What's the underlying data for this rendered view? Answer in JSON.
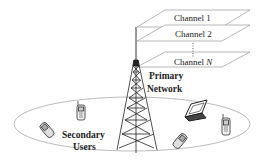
{
  "diagram": {
    "channels": [
      {
        "label": "Channel 1"
      },
      {
        "label": "Channel 2"
      },
      {
        "label": "Channel ",
        "suffix_italic": "N"
      }
    ],
    "primary_network": {
      "line1": "Primary",
      "line2": "Network"
    },
    "secondary_users": {
      "line1": "Secondary",
      "line2": "Users"
    },
    "devices": [
      "flip-phone-left",
      "cell-phone-left",
      "laptop",
      "flip-phone-right",
      "cell-phone-right"
    ],
    "colors": {
      "line": "#333333",
      "plane": "#999999",
      "ellipse": "#aaaaaa"
    }
  }
}
